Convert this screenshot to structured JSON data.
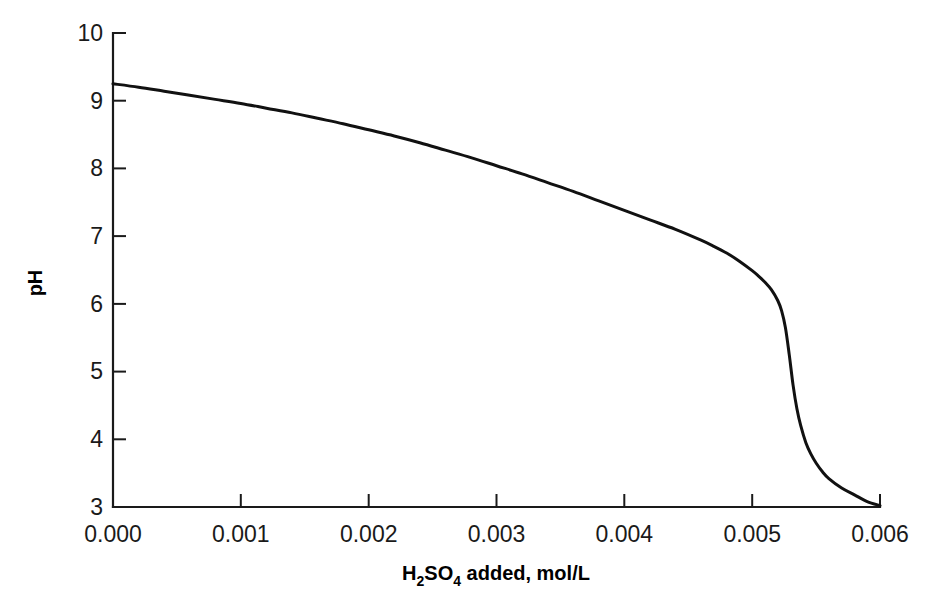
{
  "chart_data": {
    "type": "line",
    "title": "",
    "subtitle": "",
    "xlabel": "H2SO4 added, mol/L",
    "xlabel_parts": {
      "pre": "H",
      "sub1": "2",
      "mid": "SO",
      "sub2": "4",
      "post": " added, mol/L"
    },
    "ylabel": "pH",
    "xlim": [
      0.0,
      0.006
    ],
    "ylim": [
      3,
      10
    ],
    "xticks": [
      0.0,
      0.001,
      0.002,
      0.003,
      0.004,
      0.005,
      0.006
    ],
    "xtick_labels": [
      "0.000",
      "0.001",
      "0.002",
      "0.003",
      "0.004",
      "0.005",
      "0.006"
    ],
    "yticks": [
      3,
      4,
      5,
      6,
      7,
      8,
      9,
      10
    ],
    "ytick_labels": [
      "3",
      "4",
      "5",
      "6",
      "7",
      "8",
      "9",
      "10"
    ],
    "grid": false,
    "legend": false,
    "legend_position": "none",
    "series": [
      {
        "name": "pH",
        "color": "#111111",
        "x": [
          0.0,
          0.0002,
          0.0004,
          0.0006,
          0.0008,
          0.001,
          0.0012,
          0.0014,
          0.0016,
          0.0018,
          0.002,
          0.0022,
          0.0024,
          0.0026,
          0.0028,
          0.003,
          0.0032,
          0.0034,
          0.0036,
          0.0038,
          0.004,
          0.0042,
          0.0044,
          0.0046,
          0.0047,
          0.0048,
          0.0049,
          0.005,
          0.00505,
          0.0051,
          0.00515,
          0.0052,
          0.00523,
          0.00526,
          0.00529,
          0.00532,
          0.00535,
          0.00538,
          0.00542,
          0.00546,
          0.0055,
          0.00555,
          0.0056,
          0.0057,
          0.0058,
          0.0059,
          0.006
        ],
        "y": [
          9.25,
          9.2,
          9.14,
          9.08,
          9.02,
          8.96,
          8.89,
          8.82,
          8.74,
          8.66,
          8.57,
          8.48,
          8.38,
          8.27,
          8.16,
          8.04,
          7.92,
          7.79,
          7.66,
          7.52,
          7.38,
          7.24,
          7.1,
          6.94,
          6.85,
          6.75,
          6.63,
          6.49,
          6.41,
          6.32,
          6.21,
          6.05,
          5.9,
          5.65,
          5.25,
          4.8,
          4.45,
          4.2,
          3.95,
          3.78,
          3.65,
          3.52,
          3.42,
          3.28,
          3.18,
          3.08,
          3.02
        ]
      }
    ]
  },
  "axes": {
    "y_axis_name": "pH axis",
    "x_axis_name": "H2SO4 added axis"
  }
}
